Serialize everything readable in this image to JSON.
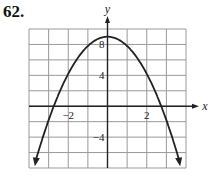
{
  "problem_number": "62.",
  "chart_data": {
    "type": "line",
    "title": "",
    "xlabel": "x",
    "ylabel": "y",
    "xlim": [
      -4,
      4
    ],
    "ylim": [
      -8,
      10
    ],
    "grid": true,
    "x_grid_step": 1,
    "y_grid_step": 2,
    "x_tick_labels": [
      "-2",
      "2"
    ],
    "y_tick_labels": [
      "8",
      "4",
      "-4"
    ],
    "series": [
      {
        "name": "parabola",
        "equation_estimate": "y = 9 - 1.2x^2",
        "x": [
          -3.65,
          -3,
          -2.74,
          -2,
          -1,
          0,
          1,
          2,
          2.74,
          3,
          3.65
        ],
        "values": [
          -7,
          -1.8,
          0,
          4.2,
          7.8,
          9,
          7.8,
          4.2,
          0,
          -1.8,
          -7
        ]
      }
    ],
    "arrows_on_ends": true
  }
}
